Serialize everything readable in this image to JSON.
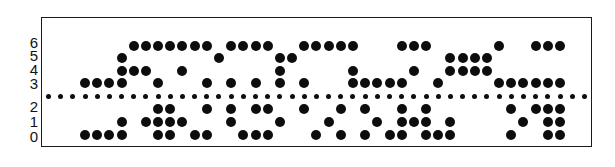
{
  "figure": {
    "type": "punched-paper-tape",
    "tape_border_color": "#1a1a1a",
    "hole_color": "#0d0d0d"
  },
  "layout": {
    "column_x0": 85.0,
    "column_pitch": 12.18,
    "row_y": {
      "6": 46,
      "5": 58,
      "4": 71,
      "3": 83,
      "sprocket": 96,
      "2": 109,
      "1": 122,
      "0": 135
    },
    "sprocket_first_col": -3,
    "sprocket_last_col": 41
  },
  "row_labels": [
    {
      "label": "6",
      "y": 42
    },
    {
      "label": "5",
      "y": 55
    },
    {
      "label": "4",
      "y": 69
    },
    {
      "label": "3",
      "y": 83
    },
    {
      "label": "2",
      "y": 106
    },
    {
      "label": "1",
      "y": 121
    },
    {
      "label": "0",
      "y": 136
    }
  ],
  "holes": {
    "6": [
      4,
      5,
      6,
      7,
      8,
      9,
      10,
      12,
      13,
      14,
      15,
      18,
      19,
      20,
      21,
      22,
      26,
      27,
      28,
      34,
      37,
      38,
      39
    ],
    "5": [
      3,
      11,
      16,
      17,
      30,
      31,
      32,
      33
    ],
    "4": [
      3,
      4,
      5,
      8,
      16,
      22,
      27,
      30,
      31,
      32,
      33
    ],
    "3": [
      0,
      1,
      2,
      3,
      6,
      10,
      12,
      14,
      16,
      18,
      22,
      23,
      24,
      25,
      26,
      29,
      34,
      35,
      36,
      37,
      38,
      39
    ],
    "2": [
      6,
      7,
      10,
      12,
      14,
      15,
      18,
      21,
      23,
      26,
      28,
      35,
      37,
      38,
      39
    ],
    "1": [
      3,
      5,
      6,
      7,
      8,
      12,
      16,
      20,
      24,
      26,
      27,
      28,
      30,
      36,
      38,
      39
    ],
    "0": [
      0,
      1,
      2,
      3,
      6,
      7,
      9,
      10,
      13,
      14,
      15,
      19,
      21,
      23,
      25,
      26,
      28,
      29,
      30,
      35,
      38,
      39
    ]
  }
}
